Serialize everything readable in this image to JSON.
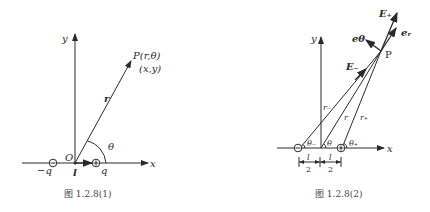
{
  "figure1": {
    "caption": "图 1.2.8(1)",
    "labels": {
      "y_axis": "y",
      "x_axis": "x",
      "origin": "O",
      "point": "P(r,θ)",
      "point_cartesian": "(x,y)",
      "radius_vector": "r",
      "angle": "θ",
      "neg_charge": "−q",
      "pos_charge": "q",
      "dipole_length": "l"
    }
  },
  "figure2": {
    "caption": "图 1.2.8(2)",
    "labels": {
      "y_axis": "y",
      "x_axis": "x",
      "point": "P",
      "e_plus": "E₊",
      "e_minus": "E₋",
      "unit_theta": "eθ",
      "unit_r": "eᵣ",
      "r_minus": "r₋",
      "r": "r",
      "r_plus": "r₊",
      "theta_minus": "θ₋",
      "theta": "θ",
      "theta_plus": "θ₊",
      "half_l_num": "l",
      "half_l_den": "2"
    }
  }
}
